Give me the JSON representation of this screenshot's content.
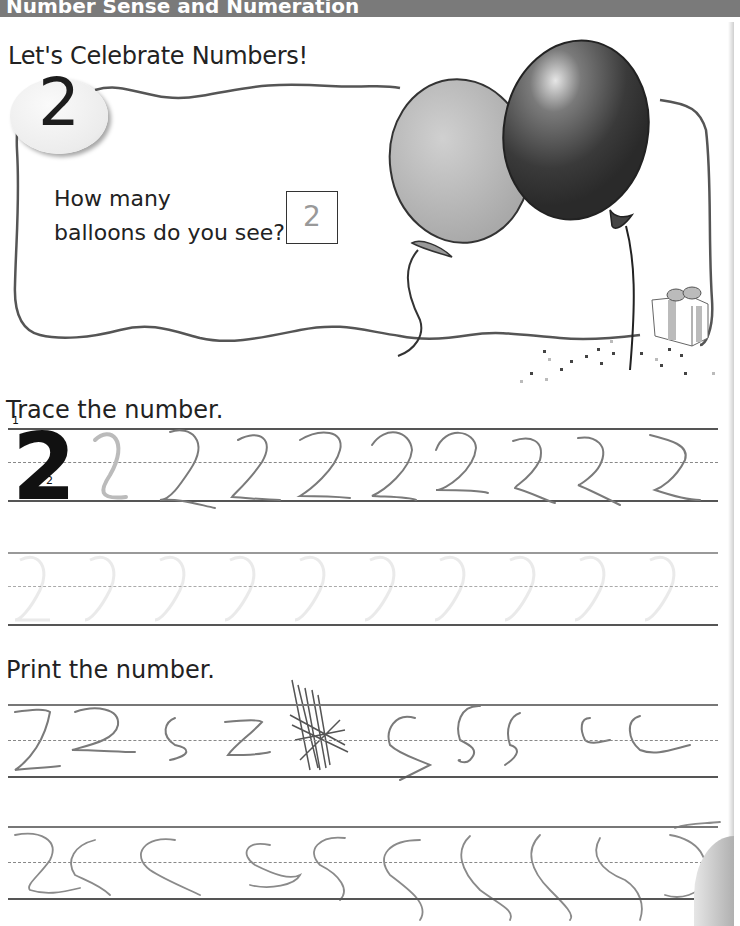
{
  "header": {
    "title": "Number Sense and Numeration"
  },
  "subtitle": "Let's Celebrate Numbers!",
  "number_card": {
    "number": "2",
    "question_line1": "How many",
    "question_line2": "balloons do you see?",
    "answer": "2"
  },
  "illustration": {
    "items": [
      "balloon-light-gray",
      "balloon-dark",
      "gift-box",
      "confetti"
    ]
  },
  "trace_section": {
    "label": "Trace the number.",
    "model_digit": "2",
    "stroke_order": [
      "1",
      "2"
    ],
    "traced_digits": [
      "2",
      "2",
      "2",
      "2",
      "2",
      "2",
      "2",
      "2",
      "2"
    ],
    "faded_guide_digits": [
      "2",
      "2",
      "2",
      "2",
      "2",
      "2",
      "2",
      "2",
      "2",
      "2"
    ]
  },
  "print_section": {
    "label": "Print the number.",
    "row1_handwriting": [
      "2",
      "2",
      "5",
      "2",
      "scribble",
      "5",
      "5",
      "5",
      "5",
      "5",
      "5"
    ],
    "row2_handwriting": [
      "2",
      "5",
      "5",
      "5",
      "5",
      "5",
      "5",
      "5",
      "5",
      "5"
    ]
  },
  "colors": {
    "header_bg": "#7a7a7a",
    "header_text": "#ffffff",
    "line_color": "#555555",
    "pencil": "#6f6f6f"
  }
}
